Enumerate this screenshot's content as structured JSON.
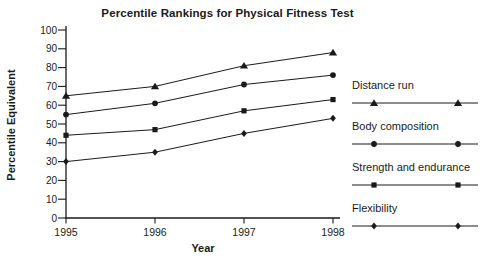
{
  "chart_data": {
    "type": "line",
    "title": "Percentile Rankings for Physical Fitness Test",
    "xlabel": "Year",
    "ylabel": "Percentile Equivalent",
    "categories": [
      "1995",
      "1996",
      "1997",
      "1998"
    ],
    "yticks": [
      0,
      10,
      20,
      30,
      40,
      50,
      60,
      70,
      80,
      90,
      100
    ],
    "ylim": [
      0,
      100
    ],
    "grid": false,
    "legend_position": "right",
    "ink_color": "#1a1a1a",
    "background": "#ffffff",
    "series": [
      {
        "name": "Distance run",
        "marker": "triangle",
        "values": [
          65,
          70,
          81,
          88
        ]
      },
      {
        "name": "Body composition",
        "marker": "circle",
        "values": [
          55,
          61,
          71,
          76
        ]
      },
      {
        "name": "Strength and endurance",
        "marker": "square",
        "values": [
          44,
          47,
          57,
          63
        ]
      },
      {
        "name": "Flexibility",
        "marker": "diamond",
        "values": [
          30,
          35,
          45,
          53
        ]
      }
    ]
  }
}
